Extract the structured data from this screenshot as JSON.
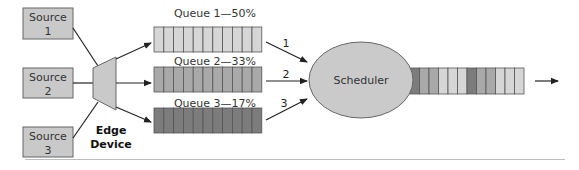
{
  "colors": {
    "box_fill": "#c9c9c9",
    "box_stroke": "#666666",
    "line": "#222222",
    "queue_light": "#d6d6d6",
    "queue_mid": "#a9a9a9",
    "queue_dark": "#7c7c7c",
    "cell_stroke": "#555555",
    "scheduler_fill": "#cacaca",
    "rule": "#bdbdbd"
  },
  "sources": [
    {
      "line1": "Source",
      "line2": "1"
    },
    {
      "line1": "Source",
      "line2": "2"
    },
    {
      "line1": "Source",
      "line2": "3"
    }
  ],
  "edge_device": {
    "line1": "Edge",
    "line2": "Device"
  },
  "queues": [
    {
      "label": "Queue 1—50%",
      "shade": "light",
      "cells": 11,
      "arrow_label": "1"
    },
    {
      "label": "Queue 2—33%",
      "shade": "mid",
      "cells": 11,
      "arrow_label": "2"
    },
    {
      "label": "Queue 3—17%",
      "shade": "dark",
      "cells": 11,
      "arrow_label": "3"
    }
  ],
  "scheduler": {
    "label": "Scheduler"
  },
  "output_queue": {
    "cells": [
      "dark",
      "mid",
      "mid",
      "light",
      "light",
      "light",
      "dark",
      "mid",
      "mid",
      "light",
      "light",
      "light"
    ]
  }
}
